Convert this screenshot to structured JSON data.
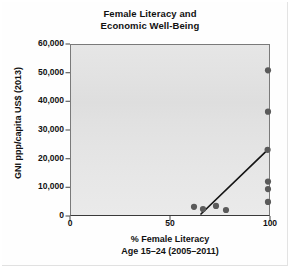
{
  "chart_data": {
    "type": "scatter",
    "title": "Female Literacy and Economic Well-Being",
    "title_line1": "Female Literacy and",
    "title_line2": "Economic Well-Being",
    "xlabel": "% Female Literacy Age 15–24 (2005–2011)",
    "xlabel_line1": "% Female Literacy",
    "xlabel_line2": "Age 15–24 (2005–2011)",
    "ylabel": "GNI ppp/capita US$ (2013)",
    "xlim": [
      0,
      100
    ],
    "ylim": [
      0,
      60000
    ],
    "xticks": [
      0,
      50,
      100
    ],
    "xtick_labels": [
      "0",
      "50",
      "100"
    ],
    "yticks": [
      0,
      10000,
      20000,
      30000,
      40000,
      50000,
      60000
    ],
    "ytick_labels": [
      "0",
      "10,000",
      "20,000",
      "30,000",
      "40,000",
      "50,000",
      "60,000"
    ],
    "grid": false,
    "legend": "none",
    "marker_color": "#5a5a5a",
    "trendline_color": "#151515",
    "plot_background": "#e4e4e4",
    "axis_color": "#6e6e6e",
    "points": [
      {
        "x": 62.0,
        "y": 3200
      },
      {
        "x": 66.5,
        "y": 2400
      },
      {
        "x": 73.0,
        "y": 3500
      },
      {
        "x": 78.0,
        "y": 2100
      },
      {
        "x": 99.0,
        "y": 50800
      },
      {
        "x": 99.0,
        "y": 36400
      },
      {
        "x": 98.8,
        "y": 23100
      },
      {
        "x": 99.0,
        "y": 12000
      },
      {
        "x": 99.0,
        "y": 9400
      },
      {
        "x": 99.0,
        "y": 4900
      }
    ],
    "trendline": {
      "x0": 65.5,
      "y0": 700,
      "x1": 98.8,
      "y1": 23100
    }
  },
  "figure": {
    "type_label": "scatter-plot"
  }
}
